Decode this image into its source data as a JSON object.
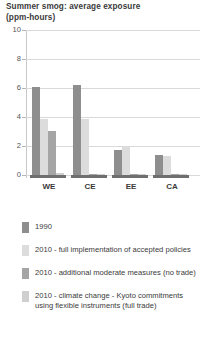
{
  "chart_data": {
    "type": "bar",
    "title": "Summer smog: average exposure\n(ppm-hours)",
    "title_line1": "Summer smog: average exposure",
    "title_line2": "(ppm-hours)",
    "xlabel": "",
    "ylabel": "",
    "ylim": [
      0,
      10
    ],
    "yticks": [
      0,
      2,
      4,
      6,
      8,
      10
    ],
    "ytick_labels": [
      "0",
      "2",
      "4",
      "6",
      "8",
      "10"
    ],
    "grid": true,
    "legend_position": "bottom",
    "categories": [
      "WE",
      "CE",
      "EE",
      "CA"
    ],
    "series": [
      {
        "name": "1990",
        "color": "#8e8e8e",
        "values": [
          6.1,
          6.2,
          1.7,
          1.35
        ]
      },
      {
        "name": "2010 - full implementation of accepted policies",
        "color": "#dcdcdc",
        "values": [
          3.85,
          3.85,
          2.0,
          1.3
        ]
      },
      {
        "name": "2010 - additional moderate measures (no trade)",
        "color": "#a5a5a5",
        "values": [
          3.05,
          0.1,
          0.05,
          0.05
        ]
      },
      {
        "name": "2010 - climate change - Kyoto commitments\nusing flexible instruments (full trade)",
        "color": "#cfcfcf",
        "values": [
          0.12,
          0.08,
          0.05,
          0.05
        ]
      }
    ]
  },
  "legend": {
    "items": [
      {
        "label": "1990",
        "color": "#8e8e8e"
      },
      {
        "label": "2010 - full implementation of accepted policies",
        "color": "#dcdcdc"
      },
      {
        "label": "2010 - additional moderate measures (no trade)",
        "color": "#a5a5a5"
      },
      {
        "label": "2010 - climate change - Kyoto commitments\nusing flexible instruments (full trade)",
        "color": "#cfcfcf"
      }
    ]
  },
  "axis": {
    "y_max": 10,
    "y_min": 0
  }
}
